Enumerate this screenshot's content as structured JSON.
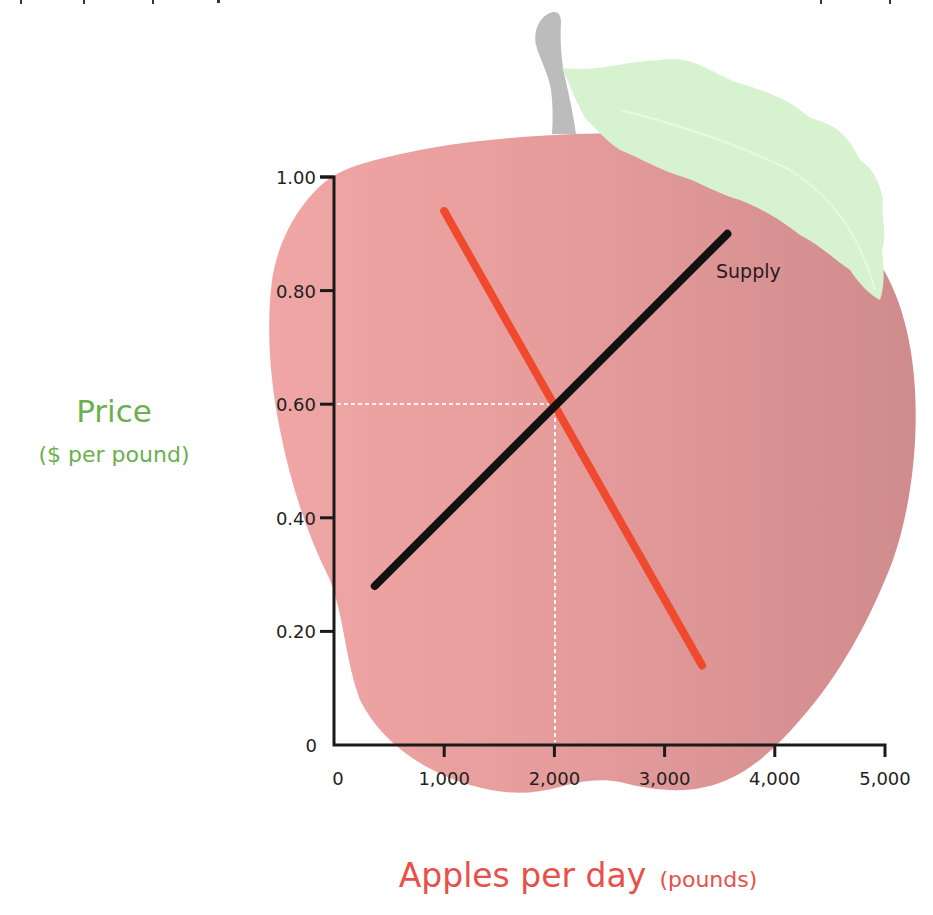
{
  "chart_data": {
    "type": "line",
    "title": "",
    "xlabel": "Apples per day",
    "xlabel_unit": "(pounds)",
    "ylabel": "Price",
    "ylabel_unit": "($ per pound)",
    "xlim": [
      0,
      5000
    ],
    "ylim": [
      0,
      1.0
    ],
    "x_ticks": [
      "0",
      "1,000",
      "2,000",
      "3,000",
      "4,000",
      "5,000"
    ],
    "y_ticks": [
      "0",
      "0.20",
      "0.40",
      "0.60",
      "0.80",
      "1.00"
    ],
    "grid": false,
    "legend": "none (inline label)",
    "series": [
      {
        "name": "Demand",
        "color": "#f04a2e",
        "labeled": false,
        "points": [
          [
            1000,
            0.94
          ],
          [
            3340,
            0.14
          ]
        ]
      },
      {
        "name": "Supply",
        "color": "#111111",
        "labeled": true,
        "points": [
          [
            370,
            0.28
          ],
          [
            3570,
            0.9
          ]
        ]
      }
    ],
    "annotations": [
      {
        "type": "equilibrium",
        "x": 2000,
        "y": 0.6,
        "style": "white dashed guide lines to both axes"
      }
    ],
    "background_illustration": "apple with stem and leaf"
  },
  "labels": {
    "y_main": "Price",
    "y_sub": "($ per pound)",
    "x_main": "Apples per day",
    "x_sub": "(pounds)",
    "supply": "Supply",
    "x_ticks": [
      "0",
      "1,000",
      "2,000",
      "3,000",
      "4,000",
      "5,000"
    ],
    "y_ticks": [
      "0",
      "0.20",
      "0.40",
      "0.60",
      "0.80",
      "1.00"
    ]
  },
  "colors": {
    "y_label": "#6ab04c",
    "x_label": "#e8504a",
    "demand": "#f04a2e",
    "supply": "#111111",
    "apple_light": "#eea3a1",
    "apple_dark": "#d38e8f",
    "leaf": "#d6f2cf",
    "stem": "#b9b9b9"
  }
}
